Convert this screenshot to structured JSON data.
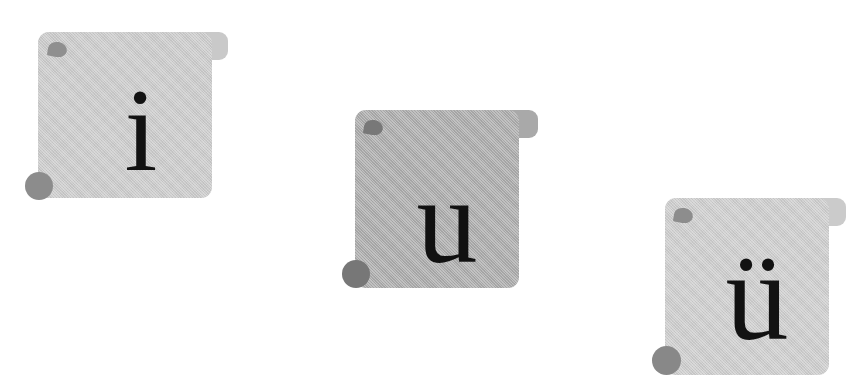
{
  "scene": {
    "background_color": "#ffffff",
    "width": 861,
    "height": 384,
    "description": "Three rounded gray flashcard tags arranged diagonally, each showing one vowel letter"
  },
  "cards": [
    {
      "id": "card-i",
      "letter": "i",
      "fill_color": "#c9c9c9",
      "tab_color": "#c9c9c9",
      "leaf_color": "#8f8f8f",
      "curl_color": "#8c8c8c",
      "letter_color": "#121212",
      "body": {
        "left": 38,
        "top": 32,
        "width": 174,
        "height": 166
      },
      "tab": {
        "left": 150,
        "top": 32,
        "width": 78,
        "height": 28
      },
      "leaf": {
        "left": 10,
        "top": 10,
        "width": 19,
        "height": 15
      },
      "curl": {
        "left": -13,
        "top": 140,
        "width": 28,
        "height": 28
      },
      "letter_box": {
        "left": 58,
        "top": 38,
        "width": 90,
        "height": 120
      },
      "letter_size": 118
    },
    {
      "id": "card-u",
      "letter": "u",
      "fill_color": "#a9a9a9",
      "tab_color": "#a9a9a9",
      "leaf_color": "#787878",
      "curl_color": "#777777",
      "letter_color": "#111111",
      "body": {
        "left": 355,
        "top": 110,
        "width": 164,
        "height": 178
      },
      "tab": {
        "left": 462,
        "top": 110,
        "width": 76,
        "height": 28
      },
      "leaf": {
        "left": 9,
        "top": 10,
        "width": 19,
        "height": 15
      },
      "curl": {
        "left": -13,
        "top": 150,
        "width": 28,
        "height": 28
      },
      "letter_box": {
        "left": 42,
        "top": 52,
        "width": 100,
        "height": 120
      },
      "letter_size": 122
    },
    {
      "id": "card-u-umlaut",
      "letter": "ü",
      "fill_color": "#cbcbcb",
      "tab_color": "#cbcbcb",
      "leaf_color": "#8d8d8d",
      "curl_color": "#888888",
      "letter_color": "#121212",
      "body": {
        "left": 665,
        "top": 198,
        "width": 164,
        "height": 177
      },
      "tab": {
        "left": 772,
        "top": 198,
        "width": 74,
        "height": 28
      },
      "leaf": {
        "left": 9,
        "top": 10,
        "width": 19,
        "height": 15
      },
      "curl": {
        "left": -13,
        "top": 148,
        "width": 29,
        "height": 29
      },
      "letter_box": {
        "left": 42,
        "top": 22,
        "width": 100,
        "height": 140
      },
      "letter_size": 126
    }
  ]
}
